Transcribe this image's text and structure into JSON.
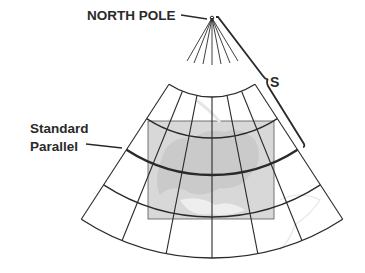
{
  "diagram": {
    "labels": {
      "pole": "NORTH POLE",
      "standard_parallel_line1": "Standard",
      "standard_parallel_line2": "Parallel",
      "slant_distance": "S"
    },
    "colors": {
      "line": "#2a2a2a",
      "map_fill": "#d9d9d9",
      "background": "#ffffff"
    },
    "geometry": {
      "pole": [
        212,
        18
      ],
      "meridian_angles_deg": [
        -33,
        -22,
        -11,
        0,
        11,
        22,
        33
      ],
      "parallel_radii": [
        79,
        120,
        157,
        199,
        240
      ],
      "standard_parallel_radius": 157,
      "map_rect": [
        148,
        121,
        126,
        98
      ]
    }
  }
}
